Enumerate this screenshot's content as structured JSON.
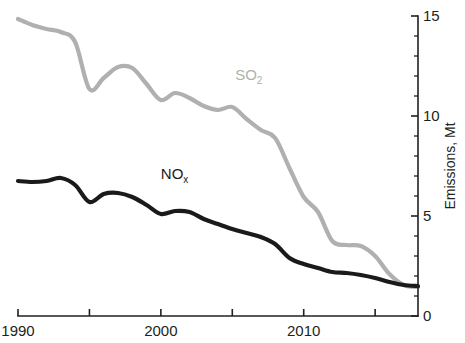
{
  "chart_data": {
    "type": "line",
    "title": "",
    "xlabel": "",
    "ylabel": "Emissions, Mt",
    "xlim": [
      1990,
      2018
    ],
    "ylim": [
      0,
      15
    ],
    "grid": false,
    "legend_position": "inline-labels",
    "x_ticks_major": [
      1990,
      2000,
      2010
    ],
    "x_ticks_all": [
      1990,
      1995,
      2000,
      2005,
      2010,
      2015
    ],
    "x_tick_labels": [
      "1990",
      "2000",
      "2010"
    ],
    "y_ticks_major": [
      0,
      5,
      10,
      15
    ],
    "y_tick_labels": [
      "0",
      "5",
      "10",
      "15"
    ],
    "y_ticks_minor": [
      1,
      2,
      3,
      4,
      6,
      7,
      8,
      9,
      11,
      12,
      13,
      14
    ],
    "x": [
      1990,
      1991,
      1992,
      1993,
      1994,
      1995,
      1996,
      1997,
      1998,
      1999,
      2000,
      2001,
      2002,
      2003,
      2004,
      2005,
      2006,
      2007,
      2008,
      2009,
      2010,
      2011,
      2012,
      2013,
      2014,
      2015,
      2016,
      2017,
      2018
    ],
    "series": [
      {
        "name": "SO2",
        "label": "SO",
        "label_sub": "2",
        "color": "#b0b0b0",
        "width": 4.2,
        "label_x": 2005.2,
        "label_y": 11.8,
        "values": [
          14.85,
          14.55,
          14.35,
          14.2,
          13.7,
          11.35,
          11.9,
          12.45,
          12.4,
          11.6,
          10.8,
          11.15,
          10.9,
          10.5,
          10.3,
          10.45,
          9.85,
          9.3,
          8.9,
          7.4,
          5.95,
          5.2,
          3.75,
          3.55,
          3.5,
          3.0,
          2.1,
          1.55,
          1.45
        ]
      },
      {
        "name": "NOx",
        "label": "NO",
        "label_sub": "x",
        "color": "#1a1a1a",
        "width": 4.2,
        "label_x": 2000.0,
        "label_y": 6.85,
        "values": [
          6.75,
          6.7,
          6.75,
          6.9,
          6.55,
          5.7,
          6.1,
          6.15,
          5.95,
          5.55,
          5.1,
          5.25,
          5.2,
          4.85,
          4.6,
          4.35,
          4.15,
          3.95,
          3.6,
          2.9,
          2.6,
          2.4,
          2.2,
          2.15,
          2.05,
          1.9,
          1.7,
          1.55,
          1.5
        ]
      }
    ]
  },
  "axis": {
    "y_title": "Emissions, Mt"
  }
}
